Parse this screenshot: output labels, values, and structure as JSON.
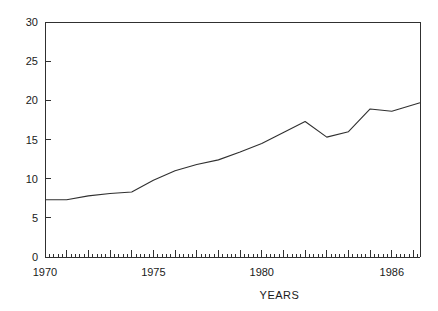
{
  "chart_data": {
    "type": "line",
    "title": "",
    "xlabel": "YEARS",
    "ylabel": "",
    "xlim": [
      1970,
      1987.3
    ],
    "ylim": [
      0,
      30
    ],
    "grid": false,
    "legend": null,
    "x_tick_labels": [
      "1970",
      "1975",
      "1980",
      "1986"
    ],
    "x_tick_values": [
      1970,
      1975,
      1980,
      1986
    ],
    "x_minor_tick_interval": 0.2,
    "y_tick_labels": [
      "0",
      "5",
      "10",
      "15",
      "20",
      "25",
      "30"
    ],
    "y_tick_values": [
      0,
      5,
      10,
      15,
      20,
      25,
      30
    ],
    "series": [
      {
        "name": "",
        "x": [
          1970,
          1971,
          1972,
          1973,
          1974,
          1975,
          1976,
          1977,
          1978,
          1979,
          1980,
          1981,
          1982,
          1983,
          1984,
          1985,
          1986,
          1987.3
        ],
        "values": [
          7.3,
          7.3,
          7.8,
          8.1,
          8.3,
          9.8,
          11.0,
          11.8,
          12.4,
          13.4,
          14.5,
          15.9,
          17.3,
          15.3,
          16.0,
          18.9,
          18.6,
          19.7
        ]
      }
    ],
    "colors": {
      "line": "#303030",
      "axis": "#303030",
      "background": "#ffffff",
      "text": "#1a1a1a"
    },
    "geometry": {
      "plot_left": 45,
      "plot_right": 420,
      "plot_top": 22,
      "plot_bottom": 257
    }
  }
}
